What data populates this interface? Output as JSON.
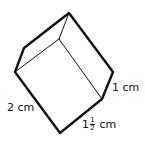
{
  "figure": {
    "type": "rectangular-prism",
    "stroke_color": "#111111",
    "labels": {
      "length": "2 cm",
      "width_whole": "1",
      "width_num": "1",
      "width_den": "2",
      "width_unit": "cm",
      "height": "1 cm"
    }
  }
}
